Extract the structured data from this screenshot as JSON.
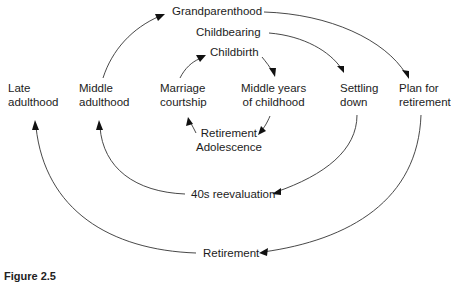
{
  "diagram": {
    "type": "life-cycle-stage-diagram",
    "nodes": {
      "grandparenthood": "Grandparenthood",
      "childbearing": "Childbearing",
      "childbirth": "Childbirth",
      "late_adulthood": [
        "Late",
        "adulthood"
      ],
      "middle_adulthood": [
        "Middle",
        "adulthood"
      ],
      "marriage_courtship": [
        "Marriage",
        "courtship"
      ],
      "middle_years_childhood": [
        "Middle years",
        "of childhood"
      ],
      "settling_down": [
        "Settling",
        "down"
      ],
      "plan_for_retirement": [
        "Plan for",
        "retirement"
      ],
      "retirement_mid": "Retirement",
      "adolescence": "Adolescence",
      "forties_reevaluation": "40s reevaluation",
      "retirement_bottom": "Retirement"
    },
    "edges": [
      {
        "from": "Middle adulthood",
        "to": "Grandparenthood"
      },
      {
        "from": "Grandparenthood",
        "to": "Plan for retirement"
      },
      {
        "from": "Childbearing",
        "to": "Settling down"
      },
      {
        "from": "Marriage courtship",
        "to": "Childbirth"
      },
      {
        "from": "Childbirth",
        "to": "Middle years of childhood"
      },
      {
        "from": "Middle years of childhood",
        "to": "Retirement / Adolescence"
      },
      {
        "from": "Retirement / Adolescence",
        "to": "Marriage courtship"
      },
      {
        "from": "Settling down",
        "to": "40s reevaluation"
      },
      {
        "from": "40s reevaluation",
        "to": "Middle adulthood"
      },
      {
        "from": "Plan for retirement",
        "to": "Retirement"
      },
      {
        "from": "Retirement",
        "to": "Late adulthood"
      }
    ],
    "caption": "Figure 2.5"
  },
  "colors": {
    "background": "#ffffff",
    "text": "#1c1c1c",
    "line": "#333333",
    "arrowhead": "#111111"
  }
}
